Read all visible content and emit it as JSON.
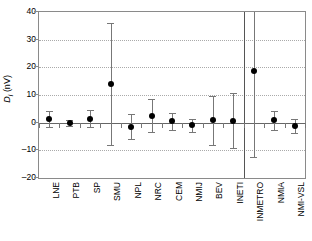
{
  "chart_data": {
    "type": "scatter",
    "title": "",
    "xlabel": "",
    "ylabel": "Di (nV)",
    "ylabel_parts": {
      "italic": "D",
      "italic_sub": "i",
      "unit": "(nV)"
    },
    "ylim": [
      -20,
      40
    ],
    "yticks": [
      40,
      30,
      20,
      10,
      0,
      -10,
      -20
    ],
    "ytick_labels": [
      "40",
      "30",
      "20",
      "10",
      "0",
      "–10",
      "–20"
    ],
    "grid": "horizontal-dotted",
    "legend": "none",
    "zero_reference_line": 0,
    "vertical_separator_after_category": "INETI",
    "categories": [
      "LNE",
      "PTB",
      "SP",
      "SMU",
      "NPL",
      "NRC",
      "CEM",
      "NMIJ",
      "BEV",
      "INETI",
      "INMETRO",
      "NMIA",
      "NMI-VSL"
    ],
    "values": [
      1.3,
      -0.2,
      1.5,
      14.0,
      -1.5,
      2.5,
      0.5,
      -1.0,
      0.8,
      0.7,
      18.5,
      0.8,
      -1.3
    ],
    "errors": [
      3.0,
      1.0,
      3.0,
      22.0,
      4.5,
      6.0,
      3.0,
      2.5,
      9.0,
      10.0,
      31.0,
      3.5,
      2.5
    ],
    "points": [
      {
        "category": "LNE",
        "value": 1.3,
        "error": 3.0,
        "low": -1.7,
        "high": 4.3,
        "clipped_high": false
      },
      {
        "category": "PTB",
        "value": -0.2,
        "error": 1.0,
        "low": -1.2,
        "high": 0.8,
        "clipped_high": false
      },
      {
        "category": "SP",
        "value": 1.5,
        "error": 3.0,
        "low": -1.5,
        "high": 4.5,
        "clipped_high": false
      },
      {
        "category": "SMU",
        "value": 14.0,
        "error": 22.0,
        "low": -8.0,
        "high": 36.0,
        "clipped_high": false
      },
      {
        "category": "NPL",
        "value": -1.5,
        "error": 4.5,
        "low": -6.0,
        "high": 3.0,
        "clipped_high": false
      },
      {
        "category": "NRC",
        "value": 2.5,
        "error": 6.0,
        "low": -3.5,
        "high": 8.5,
        "clipped_high": false
      },
      {
        "category": "CEM",
        "value": 0.5,
        "error": 3.0,
        "low": -2.5,
        "high": 3.5,
        "clipped_high": false
      },
      {
        "category": "NMIJ",
        "value": -1.0,
        "error": 2.5,
        "low": -3.5,
        "high": 1.5,
        "clipped_high": false
      },
      {
        "category": "BEV",
        "value": 0.8,
        "error": 9.0,
        "low": -8.2,
        "high": 9.8,
        "clipped_high": false
      },
      {
        "category": "INETI",
        "value": 0.7,
        "error": 10.0,
        "low": -9.3,
        "high": 10.7,
        "clipped_high": false
      },
      {
        "category": "INMETRO",
        "value": 18.5,
        "error": 31.0,
        "low": -12.5,
        "high": 49.5,
        "clipped_high": true
      },
      {
        "category": "NMIA",
        "value": 0.8,
        "error": 3.5,
        "low": -2.7,
        "high": 4.3,
        "clipped_high": false
      },
      {
        "category": "NMI-VSL",
        "value": -1.3,
        "error": 2.5,
        "low": -3.8,
        "high": 1.2,
        "clipped_high": false
      }
    ],
    "colors": {
      "marker": "#000000",
      "errorbar": "#777777",
      "gridline": "#aaaaaa",
      "frame": "#8a8a8a",
      "zeroline": "#666666",
      "separator": "#555555",
      "background": "#ffffff"
    }
  }
}
